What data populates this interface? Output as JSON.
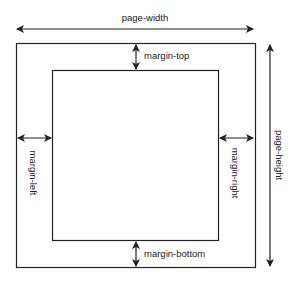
{
  "diagram": {
    "labels": {
      "page_width": "page-width",
      "page_height": "page-height",
      "margin_top": "margin-top",
      "margin_bottom": "margin-bottom",
      "margin_left": "margin-left",
      "margin_right": "margin-right"
    },
    "colors": {
      "stroke": "#222222",
      "background": "#ffffff"
    }
  }
}
